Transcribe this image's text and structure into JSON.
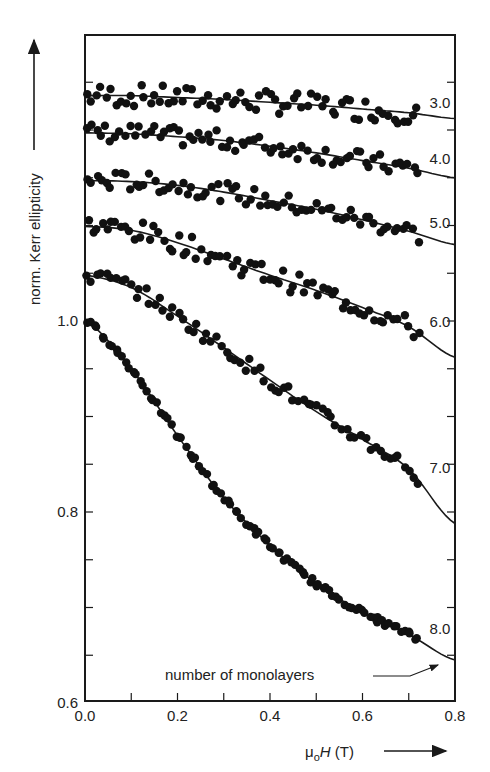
{
  "chart_data": {
    "type": "scatter",
    "title": "",
    "xlabel": "μ₀H (T)",
    "ylabel": "norm. Kerr ellipticity",
    "xlim": [
      0.0,
      0.8
    ],
    "ylim": [
      0.6,
      1.25
    ],
    "x_ticks": [
      "0.0",
      "0.2",
      "0.4",
      "0.6",
      "0.8"
    ],
    "y_ticks": [
      "0.6",
      "0.8",
      "1.0"
    ],
    "grid": false,
    "legend": null,
    "annotation": "number of monolayers",
    "note": "Curves are vertically offset for clarity; only the 8.0 curve is on absolute scale (starts at 1.0). Each series shows measured data points (filled circles) and a fitted solid line.",
    "series": [
      {
        "name": "3.0",
        "x": [
          0.0,
          0.1,
          0.2,
          0.3,
          0.4,
          0.5,
          0.6,
          0.7,
          0.8
        ],
        "values": [
          1.236,
          1.236,
          1.234,
          1.232,
          1.229,
          1.226,
          1.222,
          1.218,
          1.212
        ]
      },
      {
        "name": "4.0",
        "x": [
          0.0,
          0.1,
          0.2,
          0.3,
          0.4,
          0.5,
          0.6,
          0.7,
          0.8
        ],
        "values": [
          1.197,
          1.196,
          1.193,
          1.189,
          1.183,
          1.176,
          1.168,
          1.16,
          1.15
        ]
      },
      {
        "name": "5.0",
        "x": [
          0.0,
          0.1,
          0.2,
          0.3,
          0.4,
          0.5,
          0.6,
          0.7,
          0.8
        ],
        "values": [
          1.147,
          1.146,
          1.142,
          1.135,
          1.126,
          1.117,
          1.106,
          1.094,
          1.08
        ]
      },
      {
        "name": "6.0",
        "x": [
          0.0,
          0.1,
          0.2,
          0.3,
          0.4,
          0.5,
          0.6,
          0.7,
          0.8
        ],
        "values": [
          1.099,
          1.095,
          1.082,
          1.065,
          1.048,
          1.032,
          1.014,
          0.994,
          0.962
        ]
      },
      {
        "name": "7.0",
        "x": [
          0.0,
          0.1,
          0.2,
          0.3,
          0.4,
          0.5,
          0.6,
          0.7,
          0.8
        ],
        "values": [
          1.048,
          1.035,
          1.005,
          0.972,
          0.938,
          0.905,
          0.876,
          0.845,
          0.788
        ]
      },
      {
        "name": "8.0",
        "x": [
          0.0,
          0.1,
          0.2,
          0.3,
          0.4,
          0.5,
          0.6,
          0.7,
          0.8
        ],
        "values": [
          1.0,
          0.95,
          0.88,
          0.815,
          0.765,
          0.725,
          0.695,
          0.672,
          0.645
        ]
      }
    ]
  },
  "labels": {
    "y_axis_title": "norm. Kerr ellipticity",
    "x_axis_title_mu": "μ",
    "x_axis_title_sub": "o",
    "x_axis_title_H": "H",
    "x_axis_title_unit": " (T)",
    "annotation": "number of monolayers"
  }
}
